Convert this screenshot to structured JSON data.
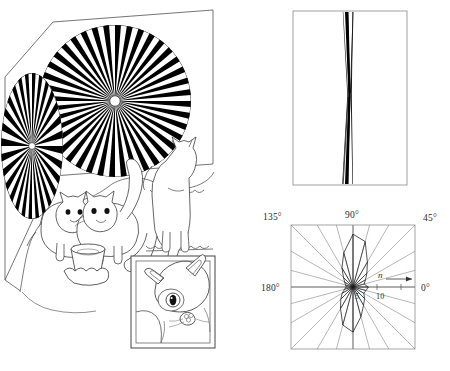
{
  "figure": {
    "title": "",
    "panels": [
      {
        "id": "panel-a",
        "name": "cat-fan-illusion",
        "kind": "line-drawing"
      },
      {
        "id": "panel-b",
        "name": "bowtie-line-pattern",
        "kind": "line-pattern"
      },
      {
        "id": "panel-c",
        "name": "polar-orientation-plot",
        "kind": "polar"
      }
    ]
  },
  "illusion": {
    "large_fan": {
      "spokes": 40,
      "center_dot": true,
      "radius_px": 76
    },
    "small_fan": {
      "spokes": 28,
      "center_dot": true,
      "rx_px": 30,
      "ry_px": 72
    },
    "cats": [
      "cat-drinking-left",
      "cat-drinking-right",
      "cat-standing-upright"
    ],
    "inset": {
      "label": "",
      "subject": "cat-head-closeup"
    }
  },
  "bowtie": {
    "lines": 3,
    "waist_y_fraction": 0.5,
    "color": "#000000"
  },
  "chart_data": {
    "type": "polar",
    "title": "",
    "xlabel": "n",
    "ylabel": "",
    "angle_unit": "degrees",
    "angle_labels": [
      "0°",
      "45°",
      "90°",
      "135°",
      "180°"
    ],
    "angle_label_positions": {
      "0": "right-middle",
      "45": "top-right",
      "90": "top-center",
      "135": "top-left",
      "180": "left-middle"
    },
    "radial_axis": {
      "label": "n",
      "ticks": [
        5,
        10
      ],
      "tick_labels": [
        "5",
        "10"
      ],
      "rmax": 12,
      "arrow": true
    },
    "grid": true,
    "grid_spokes_deg": [
      0,
      15,
      30,
      45,
      60,
      75,
      90,
      105,
      120,
      135,
      150,
      165
    ],
    "series": [
      {
        "name": "orientation-histogram",
        "theta_deg": [
          0,
          15,
          30,
          45,
          60,
          75,
          90,
          105,
          120,
          135,
          150,
          165,
          180,
          195,
          210,
          225,
          240,
          255,
          270,
          285,
          300,
          315,
          330,
          345
        ],
        "r": [
          3.2,
          2.4,
          3.0,
          4.1,
          6.0,
          9.8,
          11.0,
          7.4,
          4.6,
          2.8,
          2.0,
          1.6,
          1.4,
          1.8,
          2.6,
          3.6,
          5.2,
          8.2,
          9.4,
          6.4,
          4.4,
          3.4,
          2.6,
          2.8
        ]
      }
    ]
  },
  "labels": {
    "deg_0": "0°",
    "deg_45": "45°",
    "deg_90": "90°",
    "deg_135": "135°",
    "deg_180": "180°",
    "tick_5": "5",
    "tick_10": "10",
    "axis_n": "n"
  },
  "colors": {
    "ink": "#000000",
    "line": "#555555",
    "grid": "#888888",
    "frame": "#777777",
    "background": "#ffffff"
  }
}
